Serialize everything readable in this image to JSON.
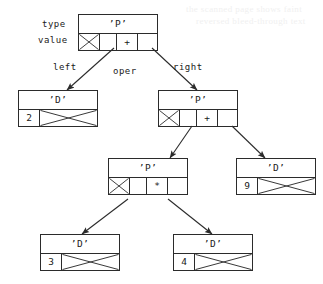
{
  "diagram": {
    "kind": "expression-tree-record-diagram",
    "field_labels": {
      "type": "type",
      "value": "value",
      "left": "left",
      "oper": "oper",
      "right": "right"
    },
    "background_bleed": [
      "the scanned page shows faint",
      "reversed bleed-through text"
    ],
    "nodes": [
      {
        "id": "root",
        "type_text": "’P’",
        "left_cell": "null",
        "oper_cell": "+",
        "right_cell": ""
      },
      {
        "id": "n-left-2",
        "type_text": "’D’",
        "value_cell": "2",
        "unused_cell": "null"
      },
      {
        "id": "n-right-2",
        "type_text": "’P’",
        "left_cell": "null",
        "oper_cell": "+",
        "right_cell": ""
      },
      {
        "id": "n-left-3",
        "type_text": "’P’",
        "left_cell": "null",
        "oper_cell": "*",
        "right_cell": ""
      },
      {
        "id": "n-right-3",
        "type_text": "’D’",
        "value_cell": "9",
        "unused_cell": "null"
      },
      {
        "id": "n-left-4",
        "type_text": "’D’",
        "value_cell": "3",
        "unused_cell": "null"
      },
      {
        "id": "n-right-4",
        "type_text": "’D’",
        "value_cell": "4",
        "unused_cell": "null"
      }
    ],
    "colors": {
      "ink": "#2b2b2b",
      "paper": "#ffffff",
      "bleed": "#f0f0f0"
    }
  }
}
